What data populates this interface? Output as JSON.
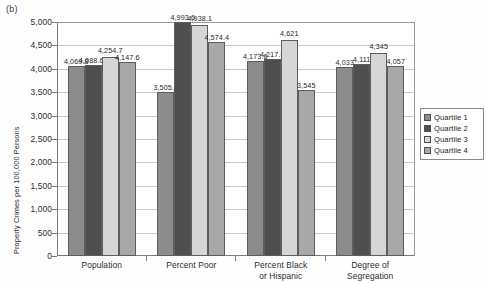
{
  "panel_label": "(b)",
  "chart_data": {
    "type": "bar",
    "title": "",
    "xlabel": "",
    "ylabel": "Property Crimes per 100,000 Persons",
    "ylim": [
      0,
      5000
    ],
    "ytick_step": 500,
    "grid": true,
    "legend_position": "right",
    "categories": [
      "Population",
      "Percent Poor",
      "Percent Black\nor Hispanic",
      "Degree of\nSegregation"
    ],
    "category_lines": [
      [
        "Population"
      ],
      [
        "Percent Poor"
      ],
      [
        "Percent Black",
        "or Hispanic"
      ],
      [
        "Degree of",
        "Segregation"
      ]
    ],
    "ytick_labels": [
      "0",
      "500",
      "1,000",
      "1,500",
      "2,000",
      "2,500",
      "3,000",
      "3,500",
      "4,000",
      "4,500",
      "5,000"
    ],
    "ytick_values": [
      0,
      500,
      1000,
      1500,
      2000,
      2500,
      3000,
      3500,
      4000,
      4500,
      5000
    ],
    "series": [
      {
        "name": "Quartile 1",
        "color": "#8c8c8c",
        "values": [
          4069.8,
          3505.1,
          4173.6,
          4033
        ],
        "labels": [
          "4,069.8",
          "3,505.1",
          "4,173.6",
          "4,033"
        ]
      },
      {
        "name": "Quartile 2",
        "color": "#4f4f4f",
        "values": [
          4088.69,
          4993.6,
          4217.6,
          4111
        ],
        "labels": [
          "4,088.69",
          "4,993.6",
          "4,217.6",
          "4,111"
        ]
      },
      {
        "name": "Quartile 3",
        "color": "#d6d6d6",
        "values": [
          4254.7,
          4938.1,
          4621,
          4345
        ],
        "labels": [
          "4,254.7",
          "4,938.1",
          "4,621",
          "4,345"
        ]
      },
      {
        "name": "Quartile 4",
        "color": "#a8a8a8",
        "values": [
          4147.6,
          4574.4,
          3545,
          4057
        ],
        "labels": [
          "4,147.6",
          "4,574.4",
          "3,545",
          "4,057"
        ]
      }
    ]
  },
  "legend": {
    "items": [
      {
        "label": "Quartile 1",
        "color": "#8c8c8c"
      },
      {
        "label": "Quartile 2",
        "color": "#4f4f4f"
      },
      {
        "label": "Quartile 3",
        "color": "#d6d6d6"
      },
      {
        "label": "Quartile 4",
        "color": "#a8a8a8"
      }
    ]
  }
}
